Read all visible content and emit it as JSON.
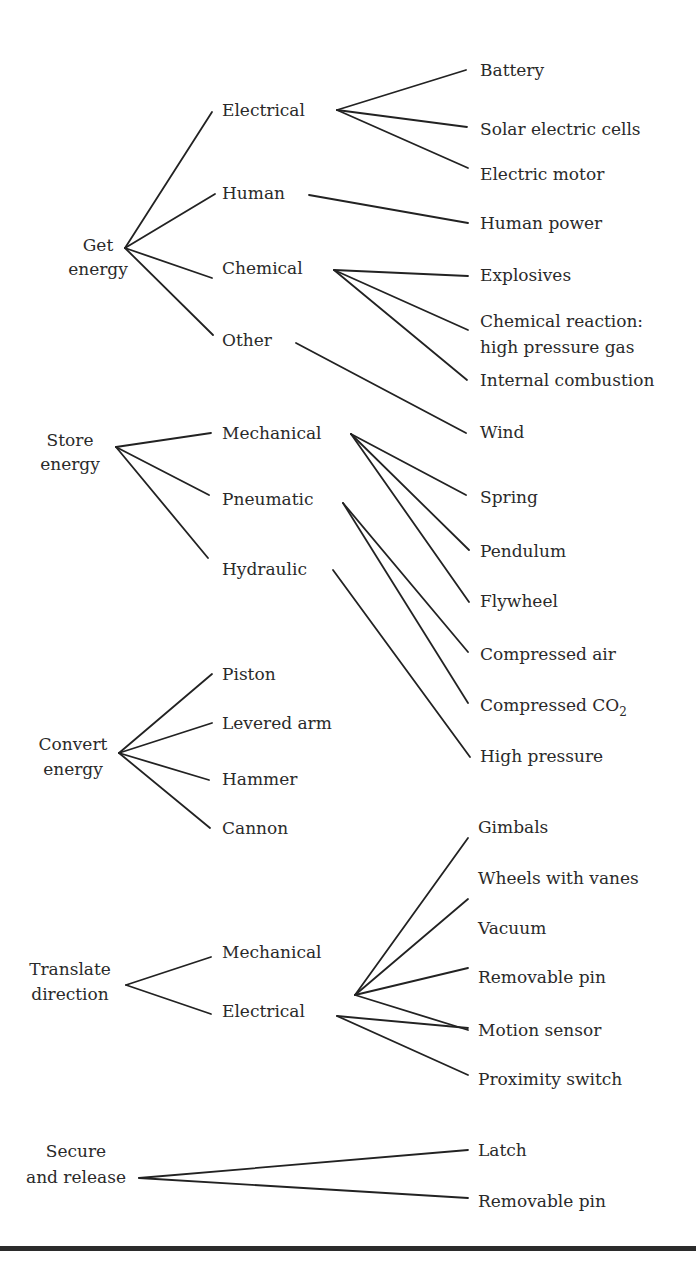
{
  "diagram": {
    "type": "tree",
    "groups": [
      {
        "label_lines": [
          "Get",
          "energy"
        ],
        "children": [
          {
            "label": "Electrical",
            "leaves": [
              "Battery",
              "Solar electric cells",
              "Electric motor"
            ]
          },
          {
            "label": "Human",
            "leaves": [
              "Human power"
            ]
          },
          {
            "label": "Chemical",
            "leaves": [
              "Explosives",
              "Chemical reaction: high pressure gas",
              "Internal combustion"
            ]
          },
          {
            "label": "Other",
            "leaves": [
              "Wind"
            ]
          }
        ]
      },
      {
        "label_lines": [
          "Store",
          "energy"
        ],
        "children": [
          {
            "label": "Mechanical",
            "leaves": [
              "Spring",
              "Pendulum",
              "Flywheel"
            ]
          },
          {
            "label": "Pneumatic",
            "leaves": [
              "Compressed air",
              "Compressed CO2"
            ]
          },
          {
            "label": "Hydraulic",
            "leaves": [
              "High pressure"
            ]
          }
        ]
      },
      {
        "label_lines": [
          "Convert",
          "energy"
        ],
        "children": [
          {
            "label": "Piston"
          },
          {
            "label": "Levered arm"
          },
          {
            "label": "Hammer"
          },
          {
            "label": "Cannon"
          }
        ]
      },
      {
        "label_lines": [
          "Translate",
          "direction"
        ],
        "children": [
          {
            "label": "Mechanical",
            "leaves": [
              "Gimbals",
              "Wheels with vanes",
              "Vacuum",
              "Removable pin"
            ]
          },
          {
            "label": "Electrical",
            "leaves": [
              "Motion sensor",
              "Proximity switch"
            ]
          }
        ]
      },
      {
        "label_lines": [
          "Secure",
          "and release"
        ],
        "leaves": [
          "Latch",
          "Removable pin"
        ]
      }
    ]
  },
  "text": {
    "get_energy": [
      "Get",
      "energy"
    ],
    "store_energy": [
      "Store",
      "energy"
    ],
    "convert_energy": [
      "Convert",
      "energy"
    ],
    "translate_direction": [
      "Translate",
      "direction"
    ],
    "secure_release": [
      "Secure",
      "and release"
    ],
    "electrical": "Electrical",
    "human": "Human",
    "chemical": "Chemical",
    "other": "Other",
    "battery": "Battery",
    "solar": "Solar electric cells",
    "motor": "Electric motor",
    "human_power": "Human power",
    "explosives": "Explosives",
    "chem_reaction": [
      "Chemical reaction:",
      "high pressure gas"
    ],
    "internal_combustion": "Internal combustion",
    "wind": "Wind",
    "store_mechanical": "Mechanical",
    "pneumatic": "Pneumatic",
    "hydraulic": "Hydraulic",
    "spring": "Spring",
    "pendulum": "Pendulum",
    "flywheel": "Flywheel",
    "compressed_air": "Compressed air",
    "compressed_co2_prefix": "Compressed CO",
    "compressed_co2_sub": "2",
    "high_pressure": "High pressure",
    "piston": "Piston",
    "levered_arm": "Levered arm",
    "hammer": "Hammer",
    "cannon": "Cannon",
    "translate_mechanical": "Mechanical",
    "translate_electrical": "Electrical",
    "gimbals": "Gimbals",
    "wheels_vanes": "Wheels with vanes",
    "vacuum": "Vacuum",
    "removable_pin_1": "Removable pin",
    "motion_sensor": "Motion sensor",
    "proximity_switch": "Proximity switch",
    "latch": "Latch",
    "removable_pin_2": "Removable pin"
  },
  "colors": {
    "ink": "#222222",
    "text": "#2a2a2a",
    "background": "#ffffff"
  }
}
